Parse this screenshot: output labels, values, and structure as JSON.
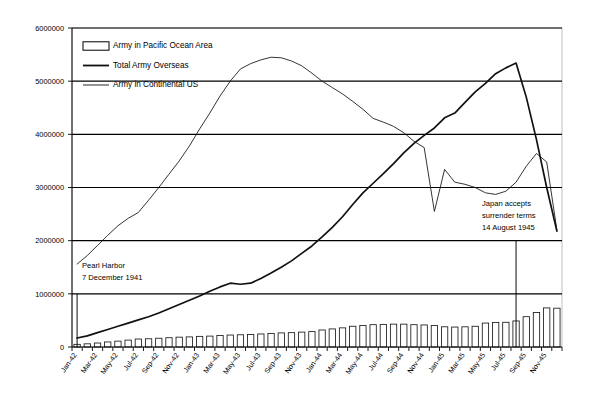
{
  "chart_data": {
    "type": "line",
    "title": "",
    "subtitle": "",
    "xlabel": "",
    "ylabel": "",
    "ylim": [
      0,
      6000000
    ],
    "y_ticks": [
      0,
      1000000,
      2000000,
      3000000,
      4000000,
      5000000,
      6000000
    ],
    "y_tick_labels": [
      "0",
      "1000000",
      "2000000",
      "3000000",
      "4000000",
      "5000000",
      "6000000"
    ],
    "grid": true,
    "legend_position": "top-left",
    "x": [
      "Jan-42",
      "Feb-42",
      "Mar-42",
      "Apr-42",
      "May-42",
      "Jun-42",
      "Jul-42",
      "Aug-42",
      "Sep-42",
      "Oct-42",
      "Nov-42",
      "Dec-42",
      "Jan-43",
      "Feb-43",
      "Mar-43",
      "Apr-43",
      "May-43",
      "Jun-43",
      "Jul-43",
      "Aug-43",
      "Sep-43",
      "Oct-43",
      "Nov-43",
      "Dec-43",
      "Jan-44",
      "Feb-44",
      "Mar-44",
      "Apr-44",
      "May-44",
      "Jun-44",
      "Jul-44",
      "Aug-44",
      "Sep-44",
      "Oct-44",
      "Nov-44",
      "Dec-44",
      "Jan-45",
      "Feb-45",
      "Mar-45",
      "Apr-45",
      "May-45",
      "Jun-45",
      "Jul-45",
      "Aug-45",
      "Sep-45",
      "Oct-45",
      "Nov-45",
      "Dec-45"
    ],
    "x_tick_labels": [
      "Jan-42",
      "Mar-42",
      "May-42",
      "Jul-42",
      "Sep-42",
      "Nov-42",
      "Jan-43",
      "Mar-43",
      "May-43",
      "Jul-43",
      "Sep-43",
      "Nov-43",
      "Jan-44",
      "Mar-44",
      "May-44",
      "Jul-44",
      "Sep-44",
      "Nov-44",
      "Jan-45",
      "Mar-45",
      "May-45",
      "Jul-45",
      "Sep-45",
      "Nov-45"
    ],
    "series": [
      {
        "name": "Army in Pacific Ocean Area",
        "type": "bar",
        "color": "#ffffff",
        "edge_color": "#1a1a1a",
        "values": [
          50000,
          60000,
          75000,
          95000,
          110000,
          130000,
          150000,
          155000,
          165000,
          175000,
          185000,
          190000,
          200000,
          205000,
          215000,
          225000,
          230000,
          235000,
          245000,
          255000,
          265000,
          270000,
          280000,
          290000,
          320000,
          340000,
          360000,
          390000,
          405000,
          420000,
          425000,
          430000,
          430000,
          420000,
          415000,
          405000,
          380000,
          375000,
          380000,
          390000,
          450000,
          460000,
          465000,
          490000,
          570000,
          650000,
          735000,
          730000
        ]
      },
      {
        "name": "Total Army Overseas",
        "type": "line",
        "color": "#111111",
        "values": [
          170000,
          210000,
          270000,
          330000,
          390000,
          450000,
          510000,
          570000,
          640000,
          720000,
          800000,
          880000,
          960000,
          1050000,
          1130000,
          1200000,
          1180000,
          1200000,
          1290000,
          1390000,
          1500000,
          1620000,
          1760000,
          1900000,
          2070000,
          2250000,
          2450000,
          2680000,
          2900000,
          3080000,
          3260000,
          3450000,
          3650000,
          3830000,
          3980000,
          4120000,
          4310000,
          4400000,
          4600000,
          4800000,
          4960000,
          5140000,
          5250000,
          5340000,
          4700000,
          3900000,
          3000000,
          2180000
        ]
      },
      {
        "name": "Army in Continental US",
        "type": "line",
        "color": "#111111",
        "values": [
          1560000,
          1720000,
          1910000,
          2100000,
          2280000,
          2420000,
          2530000,
          2760000,
          3000000,
          3250000,
          3500000,
          3780000,
          4100000,
          4400000,
          4720000,
          5000000,
          5230000,
          5330000,
          5400000,
          5450000,
          5440000,
          5380000,
          5290000,
          5150000,
          5000000,
          4880000,
          4760000,
          4620000,
          4470000,
          4300000,
          4230000,
          4150000,
          4030000,
          3870000,
          3750000,
          2550000,
          3340000,
          3100000,
          3060000,
          3000000,
          2900000,
          2870000,
          2930000,
          3100000,
          3400000,
          3640000,
          3480000,
          2200000
        ]
      }
    ],
    "annotations": [
      {
        "id": "pearl-harbor",
        "lines": [
          "Pearl Harbor",
          "7 December 1941"
        ],
        "marker_x": "Jan-42",
        "marker_value": 1000000,
        "text_x_px": 82,
        "text_y_px": 268
      },
      {
        "id": "japan-surrender",
        "lines": [
          "Japan accepts",
          "surrender terms",
          "14 August 1945"
        ],
        "marker_x": "Aug-45",
        "marker_value": 2000000,
        "text_x_px": 482,
        "text_y_px": 206
      }
    ],
    "legend": [
      {
        "label": "Army in Pacific Ocean Area",
        "marker": "bar-swatch"
      },
      {
        "label": "Total Army Overseas",
        "marker": "line-thick"
      },
      {
        "label": "Army in Continental US",
        "marker": "line-thin"
      }
    ]
  }
}
